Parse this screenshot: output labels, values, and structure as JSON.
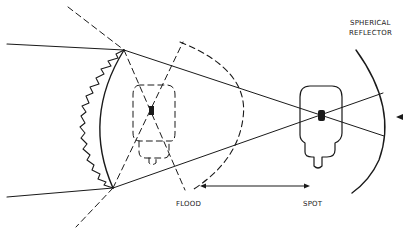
{
  "diagram": {
    "labels": {
      "reflector_line1": "SPHERICAL",
      "reflector_line2": "REFLECTOR",
      "flood": "FLOOD",
      "spot": "SPOT"
    },
    "elements": {
      "lens": "plano-convex fresnel lens (stepped left face)",
      "lamp_flood_position": "dashed lamp outline near lens",
      "lamp_spot_position": "solid lamp outline near reflector",
      "travel_arrow": "double-headed arrow between FLOOD and SPOT positions",
      "pointer": "small triangle pointing at reflector"
    },
    "colors": {
      "ink": "#1a1a1a",
      "background": "#ffffff"
    }
  }
}
